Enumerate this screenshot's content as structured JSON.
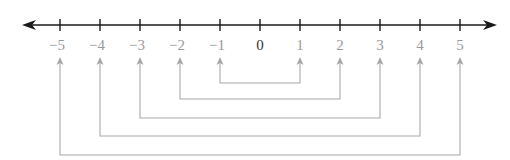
{
  "diagram": {
    "type": "number-line-opposites",
    "axis": {
      "min": -5,
      "max": 5,
      "arrows": "both",
      "color": "#1a1a1a"
    },
    "ticks": [
      {
        "value": -5,
        "label": "−5",
        "x": 60
      },
      {
        "value": -4,
        "label": "−4",
        "x": 100
      },
      {
        "value": -3,
        "label": "−3",
        "x": 140
      },
      {
        "value": -2,
        "label": "−2",
        "x": 180
      },
      {
        "value": -1,
        "label": "−1",
        "x": 220
      },
      {
        "value": 0,
        "label": "0",
        "x": 260
      },
      {
        "value": 1,
        "label": "1",
        "x": 300
      },
      {
        "value": 2,
        "label": "2",
        "x": 340
      },
      {
        "value": 3,
        "label": "3",
        "x": 380
      },
      {
        "value": 4,
        "label": "4",
        "x": 420
      },
      {
        "value": 5,
        "label": "5",
        "x": 460
      }
    ],
    "pairs": [
      {
        "a": -1,
        "b": 1,
        "bottom_y": 83
      },
      {
        "a": -2,
        "b": 2,
        "bottom_y": 99
      },
      {
        "a": -3,
        "b": 3,
        "bottom_y": 118
      },
      {
        "a": -4,
        "b": 4,
        "bottom_y": 136
      },
      {
        "a": -5,
        "b": 5,
        "bottom_y": 155
      }
    ],
    "colors": {
      "axis": "#1a1a1a",
      "zero_label": "#333333",
      "labels": "#9a9a9a",
      "connectors": "#a8a8a8"
    }
  }
}
